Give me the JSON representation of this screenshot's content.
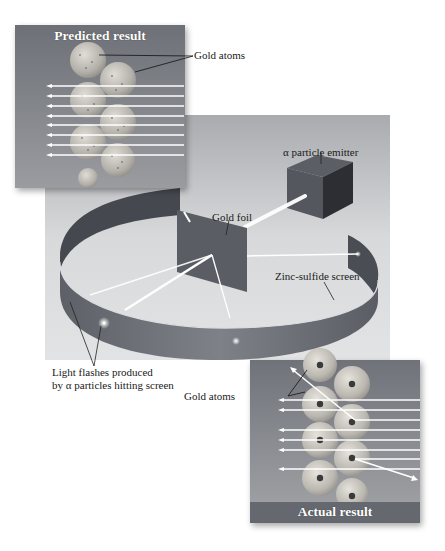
{
  "figure": {
    "predicted_panel": {
      "title": "Predicted result",
      "atoms_label": "Gold atoms",
      "alpha_beams": 8,
      "deflected_beams": 0
    },
    "apparatus": {
      "emitter_label": "α particle emitter",
      "foil_label": "Gold foil",
      "screen_label": "Zinc-sulfide screen",
      "flashes_label_line1": "Light flashes produced",
      "flashes_label_line2": "by α particles hitting screen"
    },
    "actual_panel": {
      "title": "Actual result",
      "atoms_label": "Gold atoms",
      "alpha_beams": 9,
      "deflected_beams": 2,
      "reflected_beams": 1
    }
  },
  "colors": {
    "panel_bg": "#7c7f86",
    "panel_title_bar": "#6a6d74",
    "stage_bg": "#c9cacd",
    "ring": "#6f7279",
    "ring_inner": "#4f5259",
    "beam": "#ffffff",
    "atom": "#b9b7b3",
    "nucleus": "#3a3a3a"
  }
}
